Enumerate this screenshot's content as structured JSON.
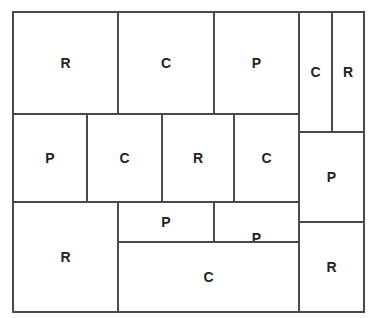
{
  "diagram": {
    "type": "grid-partition",
    "legend_letters": [
      "R",
      "C",
      "P"
    ],
    "cells": [
      {
        "label": "R",
        "x": 12,
        "y": 11,
        "w": 107,
        "h": 104
      },
      {
        "label": "C",
        "x": 117,
        "y": 11,
        "w": 98,
        "h": 104
      },
      {
        "label": "P",
        "x": 213,
        "y": 11,
        "w": 87,
        "h": 104
      },
      {
        "label": "C",
        "x": 298,
        "y": 11,
        "w": 35,
        "h": 122
      },
      {
        "label": "R",
        "x": 331,
        "y": 11,
        "w": 34,
        "h": 122
      },
      {
        "label": "P",
        "x": 12,
        "y": 113,
        "w": 76,
        "h": 90
      },
      {
        "label": "C",
        "x": 86,
        "y": 113,
        "w": 77,
        "h": 90
      },
      {
        "label": "R",
        "x": 161,
        "y": 113,
        "w": 74,
        "h": 90
      },
      {
        "label": "C",
        "x": 233,
        "y": 113,
        "w": 67,
        "h": 90
      },
      {
        "label": "P",
        "x": 298,
        "y": 131,
        "w": 67,
        "h": 92
      },
      {
        "label": "R",
        "x": 12,
        "y": 201,
        "w": 107,
        "h": 112
      },
      {
        "label": "P",
        "x": 117,
        "y": 201,
        "w": 98,
        "h": 42
      },
      {
        "label": "P",
        "x": 213,
        "y": 201,
        "w": 87,
        "h": 74
      },
      {
        "label": "C",
        "x": 117,
        "y": 241,
        "w": 183,
        "h": 72
      },
      {
        "label": "R",
        "x": 298,
        "y": 221,
        "w": 67,
        "h": 92
      }
    ]
  }
}
